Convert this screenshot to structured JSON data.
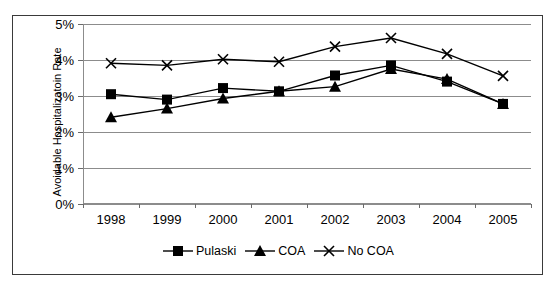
{
  "chart_data": {
    "type": "line",
    "title": "",
    "xlabel": "",
    "ylabel": "Avoidable Hospitalizatoin Rate",
    "categories": [
      "1998",
      "1999",
      "2000",
      "2001",
      "2002",
      "2003",
      "2004",
      "2005"
    ],
    "ylim": [
      0,
      5
    ],
    "ytick_values": [
      5,
      4,
      3,
      2,
      1,
      0
    ],
    "ytick_labels": [
      "5%",
      "4%",
      "3%",
      "2%",
      "1%",
      "0%"
    ],
    "grid": true,
    "legend_position": "bottom",
    "units": "percent",
    "series": [
      {
        "name": "Pulaski",
        "marker": "square",
        "color": "#000000",
        "values": [
          3.05,
          2.9,
          3.22,
          3.13,
          3.57,
          3.85,
          3.4,
          2.78
        ]
      },
      {
        "name": "COA",
        "marker": "triangle",
        "color": "#000000",
        "values": [
          2.41,
          2.65,
          2.93,
          3.13,
          3.26,
          3.75,
          3.47,
          2.78
        ]
      },
      {
        "name": "No COA",
        "marker": "x",
        "color": "#000000",
        "values": [
          3.91,
          3.85,
          4.02,
          3.95,
          4.37,
          4.61,
          4.17,
          3.56
        ]
      }
    ]
  },
  "legend": {
    "items": [
      {
        "label": "Pulaski",
        "marker": "square"
      },
      {
        "label": "COA",
        "marker": "triangle"
      },
      {
        "label": "No COA",
        "marker": "x"
      }
    ]
  }
}
